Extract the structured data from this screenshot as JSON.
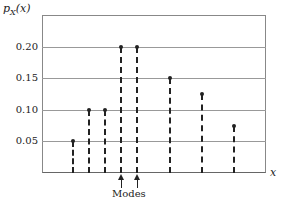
{
  "chart_data": {
    "type": "stem",
    "title": "",
    "ylabel": "p_X(x)",
    "xlabel": "x",
    "ylim": [
      0,
      0.25
    ],
    "yticks": [
      "0.05",
      "0.10",
      "0.15",
      "0.20"
    ],
    "grid": true,
    "x_positions_px": [
      73,
      89,
      105,
      121,
      137,
      170,
      202,
      234
    ],
    "values": [
      0.05,
      0.1,
      0.1,
      0.2,
      0.2,
      0.15,
      0.125,
      0.075
    ],
    "annotations": [
      {
        "text": "Modes",
        "points_to": [
          3,
          4
        ]
      }
    ]
  },
  "labels": {
    "ylabel_main": "p",
    "ylabel_sub": "X",
    "ylabel_arg": "(x)",
    "xlabel": "x",
    "modes": "Modes"
  }
}
